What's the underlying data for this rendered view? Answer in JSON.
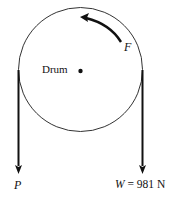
{
  "diagram": {
    "drum_label": "Drum",
    "force_label": "F",
    "left_force_label": "P",
    "right_force_label_var": "W",
    "right_force_label_eq": "=",
    "right_force_label_value": "981 N"
  },
  "colors": {
    "line": "#111111",
    "circle": "#333333"
  }
}
